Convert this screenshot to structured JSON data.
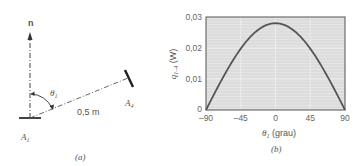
{
  "panel_a": {
    "normal_label": "n",
    "angle_label": "θ",
    "angle_sub": "1",
    "distance_label": "0,5 m",
    "surface1_label": "A",
    "surface1_sub": "1",
    "surface4_label": "A",
    "surface4_sub": "4",
    "caption": "(a)"
  },
  "panel_b": {
    "ylabel": "q",
    "ylabel_sub": "1–4",
    "ylabel_unit": " (W)",
    "xlabel_sym": "θ",
    "xlabel_sub": "1",
    "xlabel_unit": " (grau)",
    "caption": "(b)",
    "yticks": [
      "0,03",
      "0,02",
      "0,01",
      "0"
    ],
    "xticks": [
      "–90",
      "–45",
      "0",
      "45",
      "90"
    ]
  },
  "chart_data": {
    "type": "line",
    "title": "",
    "xlabel": "θ1 (grau)",
    "ylabel": "q1–4 (W)",
    "xlim": [
      -90,
      90
    ],
    "ylim": [
      0,
      0.03
    ],
    "grid": true,
    "x": [
      -90,
      -75,
      -60,
      -45,
      -30,
      -15,
      0,
      15,
      30,
      45,
      60,
      75,
      90
    ],
    "series": [
      {
        "name": "q1-4",
        "values": [
          0.0,
          0.0072,
          0.014,
          0.0198,
          0.0242,
          0.027,
          0.028,
          0.027,
          0.0242,
          0.0198,
          0.014,
          0.0072,
          0.0
        ]
      }
    ],
    "xticks": [
      -90,
      -45,
      0,
      45,
      90
    ],
    "yticks": [
      0,
      0.01,
      0.02,
      0.03
    ]
  },
  "colors": {
    "plot_bg": "#dedede",
    "curve": "#555555",
    "frame": "#666666",
    "grid": "#f2f2f2"
  }
}
